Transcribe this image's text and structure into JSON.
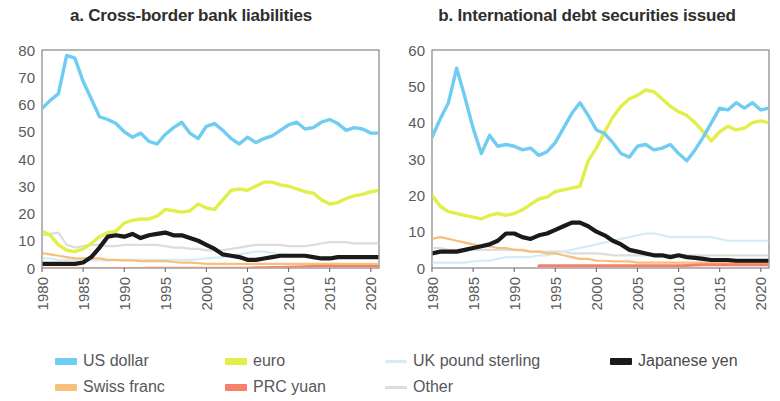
{
  "figure": {
    "background": "#ffffff"
  },
  "legend": {
    "items": [
      {
        "label": "US dollar",
        "color": "#6ecdf0",
        "weight": "thick",
        "key": "usd"
      },
      {
        "label": "euro",
        "color": "#e2ef4a",
        "weight": "thick",
        "key": "eur"
      },
      {
        "label": "UK pound  sterling",
        "color": "#d3ecf6",
        "weight": "thin",
        "key": "gbp"
      },
      {
        "label": "Japanese yen",
        "color": "#1a1a1a",
        "weight": "thick",
        "key": "jpy"
      },
      {
        "label": "Swiss franc",
        "color": "#f7c07a",
        "weight": "thick",
        "key": "chf"
      },
      {
        "label": "PRC yuan",
        "color": "#f7806a",
        "weight": "thick",
        "key": "cny"
      },
      {
        "label": "Other",
        "color": "#dddddd",
        "weight": "thin",
        "key": "oth"
      }
    ]
  },
  "chart_data": [
    {
      "type": "line",
      "panel": "a",
      "title": "a. Cross-border bank liabilities",
      "xlabel": "",
      "ylabel": "",
      "xlim": [
        1980,
        2021
      ],
      "ylim": [
        0,
        80
      ],
      "ytick_values": [
        0,
        10,
        20,
        30,
        40,
        50,
        60,
        70,
        80
      ],
      "xtick_values": [
        1980,
        1985,
        1990,
        1995,
        2000,
        2005,
        2010,
        2015,
        2020
      ],
      "xtick_labels": [
        "1980",
        "1985",
        "1990",
        "1995",
        "2000",
        "2005",
        "2010",
        "2015",
        "2020"
      ],
      "grid": false,
      "legend_position": "below-figure",
      "x": [
        1980,
        1981,
        1982,
        1983,
        1984,
        1985,
        1986,
        1987,
        1988,
        1989,
        1990,
        1991,
        1992,
        1993,
        1994,
        1995,
        1996,
        1997,
        1998,
        1999,
        2000,
        2001,
        2002,
        2003,
        2004,
        2005,
        2006,
        2007,
        2008,
        2009,
        2010,
        2011,
        2012,
        2013,
        2014,
        2015,
        2016,
        2017,
        2018,
        2019,
        2020,
        2021
      ],
      "series": [
        {
          "name": "US dollar",
          "color": "#6ecdf0",
          "width": 3.4,
          "values": [
            58.5,
            61.5,
            64.0,
            78.0,
            77.0,
            68.5,
            62.0,
            55.5,
            54.5,
            53.0,
            50.0,
            48.0,
            49.5,
            46.5,
            45.5,
            49.0,
            51.5,
            53.5,
            49.5,
            47.5,
            52.0,
            53.0,
            50.5,
            47.5,
            45.5,
            48.0,
            46.0,
            47.5,
            48.5,
            50.5,
            52.5,
            53.5,
            51.0,
            51.5,
            53.5,
            54.5,
            53.0,
            50.5,
            51.5,
            51.0,
            49.5,
            49.5
          ]
        },
        {
          "name": "euro",
          "color": "#e2ef4a",
          "width": 3.4,
          "values": [
            13.5,
            12.0,
            8.5,
            6.5,
            6.0,
            7.0,
            9.0,
            11.5,
            13.0,
            13.5,
            16.5,
            17.5,
            18.0,
            18.0,
            19.0,
            21.5,
            21.0,
            20.5,
            21.0,
            23.5,
            22.0,
            21.5,
            25.0,
            28.5,
            29.0,
            28.5,
            30.0,
            31.5,
            31.5,
            30.5,
            30.0,
            29.0,
            28.0,
            27.5,
            25.0,
            23.5,
            24.0,
            25.5,
            26.5,
            27.0,
            28.0,
            28.5
          ]
        },
        {
          "name": "Japanese yen",
          "color": "#1a1a1a",
          "width": 4.2,
          "values": [
            1.5,
            1.5,
            1.5,
            1.5,
            1.5,
            2.0,
            4.0,
            7.5,
            11.5,
            12.0,
            11.5,
            12.5,
            11.0,
            12.0,
            12.5,
            13.0,
            12.0,
            12.0,
            11.0,
            10.0,
            8.5,
            7.0,
            5.0,
            4.5,
            4.0,
            3.0,
            3.0,
            3.5,
            4.0,
            4.5,
            4.5,
            4.5,
            4.5,
            4.0,
            3.5,
            3.5,
            4.0,
            4.0,
            4.0,
            4.0,
            4.0,
            4.0
          ]
        },
        {
          "name": "UK pound  sterling",
          "color": "#d3ecf6",
          "width": 2.2,
          "values": [
            3.5,
            3.5,
            3.0,
            3.0,
            3.0,
            3.0,
            2.8,
            2.8,
            2.8,
            2.8,
            3.0,
            3.0,
            3.0,
            3.0,
            3.0,
            3.0,
            3.0,
            3.0,
            3.0,
            3.2,
            3.5,
            3.8,
            4.0,
            4.5,
            5.0,
            5.5,
            6.0,
            6.0,
            5.5,
            5.0,
            4.8,
            4.5,
            4.5,
            4.2,
            4.0,
            4.0,
            4.0,
            4.0,
            4.0,
            4.0,
            4.0,
            4.0
          ]
        },
        {
          "name": "Swiss franc",
          "color": "#f7c07a",
          "width": 2.2,
          "values": [
            5.5,
            5.0,
            4.5,
            4.0,
            3.5,
            3.5,
            3.5,
            3.5,
            3.0,
            3.0,
            2.8,
            2.8,
            2.5,
            2.5,
            2.5,
            2.5,
            2.2,
            2.0,
            2.0,
            1.8,
            1.5,
            1.5,
            1.5,
            1.5,
            1.5,
            1.5,
            1.5,
            1.5,
            1.5,
            1.5,
            1.5,
            1.5,
            1.5,
            1.5,
            1.5,
            1.5,
            1.5,
            1.5,
            1.5,
            1.5,
            1.5,
            1.5
          ]
        },
        {
          "name": "PRC yuan",
          "color": "#f7806a",
          "width": 2.2,
          "values": [
            0,
            0,
            0,
            0,
            0,
            0,
            0,
            0,
            0,
            0,
            0,
            0,
            0,
            0.1,
            0.1,
            0.1,
            0.1,
            0.1,
            0.1,
            0.1,
            0.1,
            0.1,
            0.1,
            0.1,
            0.1,
            0.1,
            0.2,
            0.2,
            0.3,
            0.3,
            0.4,
            0.5,
            0.6,
            0.7,
            0.8,
            0.8,
            0.7,
            0.7,
            0.7,
            0.7,
            0.7,
            0.7
          ]
        },
        {
          "name": "Other",
          "color": "#dddddd",
          "width": 2.2,
          "values": [
            12.0,
            12.5,
            13.0,
            8.5,
            7.5,
            8.0,
            8.5,
            8.5,
            8.0,
            8.0,
            8.5,
            8.5,
            8.5,
            8.5,
            8.5,
            8.0,
            7.5,
            7.5,
            7.0,
            7.0,
            6.5,
            6.5,
            6.5,
            7.0,
            7.5,
            8.0,
            8.5,
            8.5,
            8.5,
            8.5,
            8.0,
            8.0,
            8.0,
            8.5,
            9.0,
            9.5,
            9.5,
            9.5,
            9.0,
            9.0,
            9.0,
            9.0
          ]
        }
      ]
    },
    {
      "type": "line",
      "panel": "b",
      "title": "b. International debt securities issued",
      "xlabel": "",
      "ylabel": "",
      "xlim": [
        1980,
        2021
      ],
      "ylim": [
        0,
        60
      ],
      "ytick_values": [
        0,
        10,
        20,
        30,
        40,
        50,
        60
      ],
      "xtick_values": [
        1980,
        1985,
        1990,
        1995,
        2000,
        2005,
        2010,
        2015,
        2020
      ],
      "xtick_labels": [
        "1980",
        "1985",
        "1990",
        "1995",
        "2000",
        "2005",
        "2010",
        "2015",
        "2020"
      ],
      "grid": false,
      "legend_position": "below-figure",
      "x": [
        1980,
        1981,
        1982,
        1983,
        1984,
        1985,
        1986,
        1987,
        1988,
        1989,
        1990,
        1991,
        1992,
        1993,
        1994,
        1995,
        1996,
        1997,
        1998,
        1999,
        2000,
        2001,
        2002,
        2003,
        2004,
        2005,
        2006,
        2007,
        2008,
        2009,
        2010,
        2011,
        2012,
        2013,
        2014,
        2015,
        2016,
        2017,
        2018,
        2019,
        2020,
        2021
      ],
      "series": [
        {
          "name": "US dollar",
          "color": "#6ecdf0",
          "width": 3.4,
          "values": [
            36.0,
            41.0,
            45.5,
            55.0,
            47.0,
            38.5,
            31.5,
            36.5,
            33.5,
            34.0,
            33.5,
            32.5,
            33.0,
            31.0,
            32.0,
            34.5,
            38.5,
            42.5,
            45.5,
            42.0,
            38.0,
            37.0,
            34.5,
            31.5,
            30.5,
            33.5,
            34.0,
            32.5,
            33.0,
            34.0,
            31.5,
            29.5,
            32.5,
            36.0,
            40.0,
            44.0,
            43.5,
            45.5,
            44.0,
            45.5,
            43.5,
            44.0
          ]
        },
        {
          "name": "euro",
          "color": "#e2ef4a",
          "width": 3.4,
          "values": [
            20.0,
            17.0,
            15.5,
            15.0,
            14.5,
            14.0,
            13.5,
            14.5,
            15.0,
            14.5,
            15.0,
            16.0,
            17.5,
            19.0,
            19.5,
            21.0,
            21.5,
            22.0,
            22.5,
            29.5,
            33.0,
            37.5,
            41.5,
            44.5,
            46.5,
            47.5,
            49.0,
            48.5,
            46.5,
            44.5,
            43.0,
            42.0,
            40.0,
            37.5,
            35.0,
            37.5,
            39.0,
            38.0,
            38.5,
            40.0,
            40.5,
            40.0
          ]
        },
        {
          "name": "Japanese yen",
          "color": "#1a1a1a",
          "width": 4.2,
          "values": [
            4.0,
            4.5,
            4.5,
            4.5,
            5.0,
            5.5,
            6.0,
            6.5,
            7.5,
            9.5,
            9.5,
            8.5,
            8.0,
            9.0,
            9.5,
            10.5,
            11.5,
            12.5,
            12.5,
            11.5,
            10.0,
            9.0,
            7.5,
            6.5,
            5.0,
            4.5,
            4.0,
            3.5,
            3.5,
            3.0,
            3.5,
            3.0,
            2.8,
            2.5,
            2.2,
            2.2,
            2.2,
            2.0,
            2.0,
            2.0,
            2.0,
            2.0
          ]
        },
        {
          "name": "UK pound  sterling",
          "color": "#d3ecf6",
          "width": 2.2,
          "values": [
            1.5,
            1.5,
            1.5,
            1.5,
            1.5,
            1.8,
            2.0,
            2.0,
            2.5,
            3.0,
            3.0,
            3.0,
            3.0,
            3.5,
            3.5,
            4.0,
            4.5,
            5.0,
            5.5,
            6.0,
            6.5,
            7.0,
            7.5,
            8.0,
            8.5,
            9.0,
            9.5,
            9.5,
            9.0,
            8.5,
            8.5,
            8.5,
            8.5,
            8.5,
            8.5,
            8.0,
            7.5,
            7.5,
            7.5,
            7.5,
            7.5,
            7.5
          ]
        },
        {
          "name": "Swiss franc",
          "color": "#f7c07a",
          "width": 2.2,
          "values": [
            8.0,
            8.5,
            8.0,
            7.5,
            7.0,
            6.5,
            6.0,
            6.0,
            5.5,
            5.5,
            5.0,
            5.0,
            4.5,
            4.5,
            4.0,
            4.0,
            3.5,
            3.0,
            2.5,
            2.5,
            2.0,
            2.0,
            1.8,
            1.8,
            1.8,
            1.5,
            1.5,
            1.5,
            1.5,
            1.5,
            1.5,
            1.5,
            1.5,
            1.5,
            1.5,
            1.5,
            1.5,
            1.5,
            1.5,
            1.5,
            1.5,
            1.5
          ]
        },
        {
          "name": "PRC yuan",
          "color": "#f7806a",
          "width": 3.0,
          "values": [
            null,
            null,
            null,
            null,
            null,
            null,
            null,
            null,
            null,
            null,
            null,
            null,
            null,
            0.6,
            0.6,
            0.6,
            0.6,
            0.6,
            0.6,
            0.6,
            0.6,
            0.6,
            0.6,
            0.6,
            0.6,
            0.6,
            0.6,
            0.6,
            0.6,
            0.6,
            0.6,
            0.7,
            0.8,
            0.9,
            0.9,
            0.9,
            0.9,
            0.9,
            0.9,
            0.9,
            0.9,
            0.9
          ]
        },
        {
          "name": "Other",
          "color": "#dddddd",
          "width": 2.2,
          "values": [
            5.5,
            5.5,
            5.0,
            5.0,
            5.0,
            5.0,
            5.0,
            5.0,
            5.0,
            5.0,
            5.0,
            4.8,
            4.5,
            4.5,
            4.5,
            4.5,
            4.5,
            4.0,
            4.0,
            4.0,
            4.0,
            3.8,
            3.5,
            3.5,
            3.5,
            3.5,
            3.5,
            3.5,
            3.5,
            3.5,
            3.5,
            3.5,
            3.5,
            3.5,
            3.5,
            3.5,
            3.5,
            3.5,
            3.5,
            3.5,
            3.5,
            3.5
          ]
        }
      ]
    }
  ]
}
